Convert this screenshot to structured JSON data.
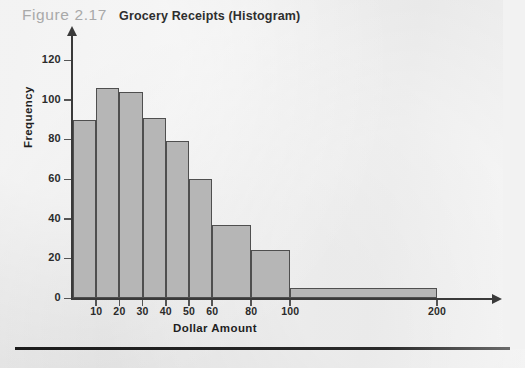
{
  "figure": {
    "number": "Figure 2.17",
    "title": "Grocery Receipts (Histogram)"
  },
  "chart_data": {
    "type": "bar",
    "title": "Grocery Receipts (Histogram)",
    "xlabel": "Dollar Amount",
    "ylabel": "Frequency",
    "xlim": [
      0,
      220
    ],
    "ylim": [
      0,
      130
    ],
    "grid": false,
    "legend": null,
    "x_tick_labels": [
      "10",
      "20",
      "30",
      "40",
      "50",
      "60",
      "80",
      "100",
      "200"
    ],
    "x_tick_values": [
      10,
      20,
      30,
      40,
      50,
      60,
      80,
      100,
      200
    ],
    "y_tick_labels": [
      "0",
      "20",
      "40",
      "60",
      "80",
      "100",
      "120"
    ],
    "y_tick_values": [
      0,
      20,
      40,
      60,
      80,
      100,
      120
    ],
    "bins": [
      {
        "label": "0-10",
        "start": 0,
        "end": 10,
        "value": 90
      },
      {
        "label": "10-20",
        "start": 10,
        "end": 20,
        "value": 106
      },
      {
        "label": "20-30",
        "start": 20,
        "end": 30,
        "value": 104
      },
      {
        "label": "30-40",
        "start": 30,
        "end": 40,
        "value": 91
      },
      {
        "label": "40-50",
        "start": 40,
        "end": 50,
        "value": 79
      },
      {
        "label": "50-60",
        "start": 50,
        "end": 60,
        "value": 60
      },
      {
        "label": "60-80",
        "start": 60,
        "end": 80,
        "value": 37
      },
      {
        "label": "80-100",
        "start": 80,
        "end": 100,
        "value": 24
      },
      {
        "label": "100-200",
        "start": 100,
        "end": 200,
        "value": 5
      }
    ],
    "colors": {
      "bar_fill": "#b6b6b6",
      "bar_border": "#4f4f4f",
      "axis": "#3a3a3a",
      "text": "#1f1f1f",
      "figure_number": "#a9a9a9",
      "background": "#e9e9e9"
    }
  }
}
